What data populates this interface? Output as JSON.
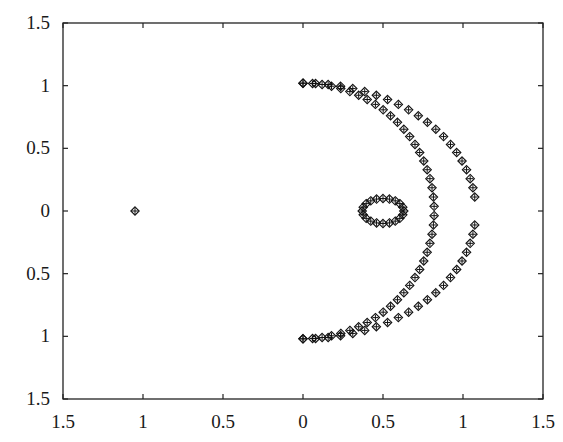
{
  "chart_data": {
    "type": "scatter",
    "title": "",
    "xlabel": "",
    "ylabel": "",
    "xlim": [
      -1.5,
      1.5
    ],
    "ylim": [
      -1.5,
      1.5
    ],
    "grid": false,
    "legend": null,
    "x_tick_labels": [
      "1.5",
      "1",
      "0.5",
      "0",
      "0.5",
      "1",
      "1.5"
    ],
    "x_ticks": [
      -1.5,
      -1,
      -0.5,
      0,
      0.5,
      1,
      1.5
    ],
    "y_tick_labels": [
      "1.5",
      "1",
      "0.5",
      "0",
      "0.5",
      "1",
      "1.5"
    ],
    "y_ticks": [
      1.5,
      1,
      0.5,
      0,
      -0.5,
      -1,
      -1.5
    ],
    "markers": [
      "diamond",
      "plus"
    ],
    "series": [
      {
        "name": "isolated point",
        "points": [
          [
            -1.05,
            0.0
          ]
        ]
      },
      {
        "name": "outer arc",
        "shape": "half-ellipse",
        "center": [
          0,
          0
        ],
        "rx": 1.08,
        "ry": 1.02,
        "gap_near_y0": 0.08,
        "n_points": 44
      },
      {
        "name": "inner arc",
        "shape": "half-ellipse",
        "center": [
          0,
          0
        ],
        "rx": 0.82,
        "ry": 1.02,
        "n_points": 44
      },
      {
        "name": "small ring",
        "shape": "ellipse",
        "center": [
          0.5,
          0.0
        ],
        "rx": 0.13,
        "ry": 0.1,
        "n_points": 20
      }
    ]
  }
}
